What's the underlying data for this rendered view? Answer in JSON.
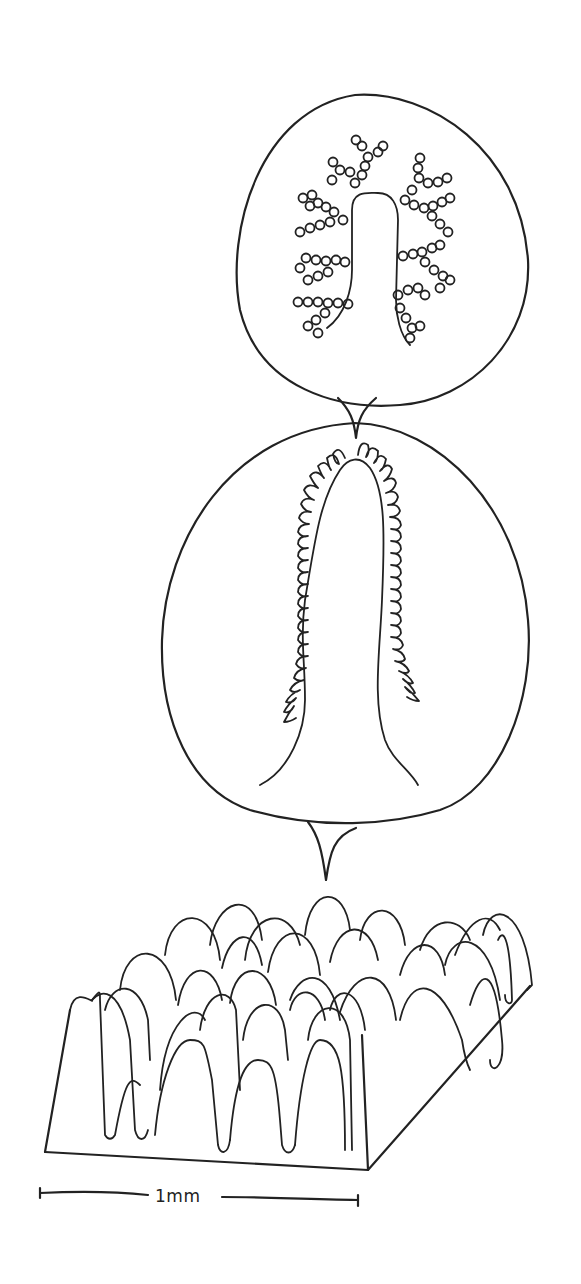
{
  "figure": {
    "title": "",
    "panels": [
      {
        "id": "top",
        "name": "magnified-microvillus-with-glycocalyx",
        "label": ""
      },
      {
        "id": "middle",
        "name": "magnified-villus-with-microvilli",
        "label": ""
      },
      {
        "id": "bottom",
        "name": "villi-surface-block",
        "label": ""
      }
    ],
    "scale_bar": {
      "label": "1mm"
    },
    "colors": {
      "line": "#222222",
      "background": "#ffffff"
    }
  }
}
